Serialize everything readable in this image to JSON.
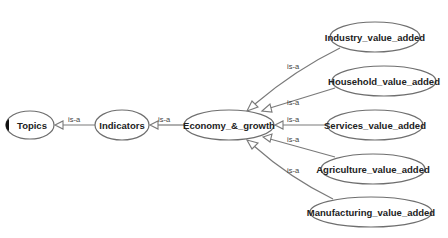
{
  "diagram": {
    "nodes": {
      "topics": {
        "label": "Topics",
        "cx": 30,
        "cy": 125,
        "rx": 24,
        "ry": 14
      },
      "indicators": {
        "label": "Indicators",
        "cx": 122,
        "cy": 125,
        "rx": 27,
        "ry": 15
      },
      "economy": {
        "label": "Economy_&_growth",
        "cx": 229,
        "cy": 125,
        "rx": 44,
        "ry": 15
      },
      "industry": {
        "label": "Industry_value_added",
        "cx": 375,
        "cy": 37,
        "rx": 45,
        "ry": 15
      },
      "household": {
        "label": "Household_value_added",
        "cx": 383,
        "cy": 81,
        "rx": 52,
        "ry": 15
      },
      "services": {
        "label": "Services_value_added",
        "cx": 374,
        "cy": 125,
        "rx": 47,
        "ry": 15
      },
      "agriculture": {
        "label": "Agriculture_value_added",
        "cx": 372,
        "cy": 169,
        "rx": 52,
        "ry": 15
      },
      "manufacturing": {
        "label": "Manufacturing_value_added",
        "cx": 370,
        "cy": 212,
        "rx": 60,
        "ry": 15
      }
    },
    "edges": [
      {
        "from": "indicators",
        "to": "topics",
        "label": "is-a"
      },
      {
        "from": "economy",
        "to": "indicators",
        "label": "is-a"
      },
      {
        "from": "industry",
        "to": "economy",
        "label": "is-a"
      },
      {
        "from": "household",
        "to": "economy",
        "label": "is-a"
      },
      {
        "from": "services",
        "to": "economy",
        "label": "is-a"
      },
      {
        "from": "agriculture",
        "to": "economy",
        "label": "is-a"
      },
      {
        "from": "manufacturing",
        "to": "economy",
        "label": "is-a"
      }
    ]
  }
}
